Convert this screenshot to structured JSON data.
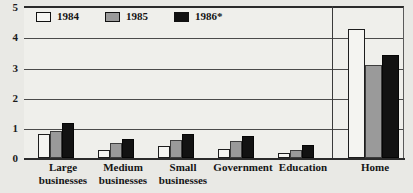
{
  "chart_data": {
    "type": "bar",
    "title": "",
    "xlabel": "",
    "ylabel": "",
    "ylim": [
      0,
      5
    ],
    "yticks": [
      "0",
      "1",
      "2",
      "3",
      "4",
      "5"
    ],
    "grid": true,
    "legend_position": "top-left",
    "categories": [
      "Large businesses",
      "Medium businesses",
      "Small businesses",
      "Government",
      "Education",
      "Home"
    ],
    "category_lines": [
      [
        "Large",
        "businesses"
      ],
      [
        "Medium",
        "businesses"
      ],
      [
        "Small",
        "businesses"
      ],
      [
        "Government"
      ],
      [
        "Education"
      ],
      [
        "Home"
      ]
    ],
    "series": [
      {
        "name": "1984",
        "color": "#f4f4f1",
        "values": [
          0.78,
          0.27,
          0.38,
          0.3,
          0.15,
          4.25
        ]
      },
      {
        "name": "1985",
        "color": "#9a9a9a",
        "values": [
          0.9,
          0.5,
          0.6,
          0.55,
          0.27,
          3.05
        ]
      },
      {
        "name": "1986*",
        "color": "#121212",
        "values": [
          1.15,
          0.62,
          0.78,
          0.72,
          0.42,
          3.38
        ]
      }
    ]
  },
  "legend": {
    "items": [
      {
        "label": "1984"
      },
      {
        "label": "1985"
      },
      {
        "label": "1986*"
      }
    ]
  },
  "colors": {
    "background": "#e9e9e5",
    "plot_background": "#efefeb",
    "axis": "#2b2b2b",
    "gridline": "#4a4a4a"
  }
}
